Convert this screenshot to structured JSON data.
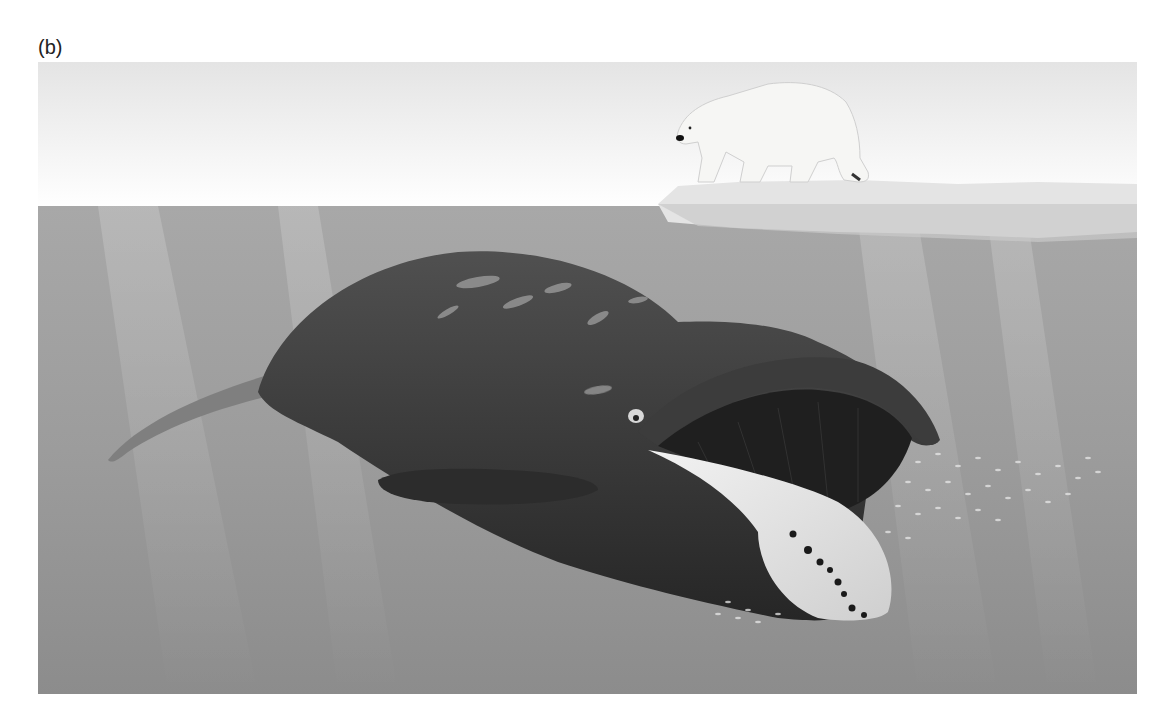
{
  "figure": {
    "panel_label": "(b)",
    "elements": [
      {
        "name": "sky",
        "description": "pale white-gray gradient sky"
      },
      {
        "name": "sea-ice",
        "description": "ice floe at the surface, right side"
      },
      {
        "name": "polar-bear",
        "description": "polar bear walking on ice floe, facing left"
      },
      {
        "name": "water",
        "description": "gray water with vertical light rays"
      },
      {
        "name": "bowhead-whale",
        "description": "large dark whale with open mouth showing baleen and white chin"
      },
      {
        "name": "prey-swarm",
        "description": "cloud of small zooplankton near the whale's mouth"
      }
    ],
    "colors": {
      "sky_top": "#e6e6e6",
      "sky_bottom": "#ffffff",
      "water_top": "#a9a9a9",
      "water_bottom": "#8e8e8e",
      "whale": "#3a3a3a",
      "whale_chin": "#e2e2e2",
      "ice": "#e9e9e9"
    }
  }
}
